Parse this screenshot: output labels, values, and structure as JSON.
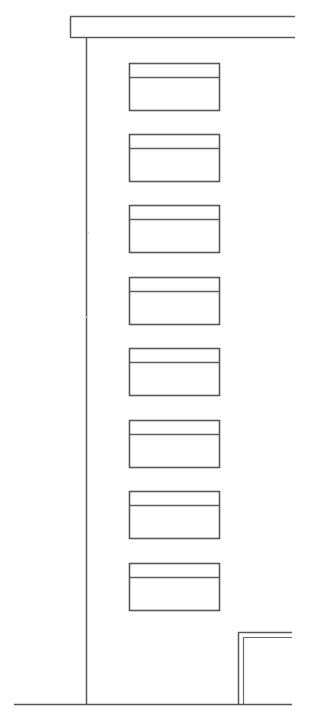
{
  "drawing": {
    "type": "architectural-elevation",
    "title": "Building Elevation",
    "canvas": {
      "width": 309,
      "height": 728
    },
    "background_color": "#ffffff",
    "line_color": "#5a5a5a",
    "fill_color": "#ffffff"
  },
  "roof_band": {
    "name": "roof-parapet-band",
    "x": 70,
    "y": 16,
    "width": 225,
    "height": 21,
    "left_capped": true,
    "right_open": true
  },
  "wall_line": {
    "name": "front-wall-edge",
    "x": 86,
    "y_top": 37,
    "y_bottom": 704
  },
  "windows": {
    "count": 8,
    "left": 129,
    "right": 219,
    "width": 90,
    "height": 47,
    "pitch": 71,
    "transom_offset": 14,
    "items": [
      {
        "label": "window-floor-8",
        "top": 63
      },
      {
        "label": "window-floor-7",
        "top": 134
      },
      {
        "label": "window-floor-6",
        "top": 205
      },
      {
        "label": "window-floor-5",
        "top": 277
      },
      {
        "label": "window-floor-4",
        "top": 348
      },
      {
        "label": "window-floor-3",
        "top": 420
      },
      {
        "label": "window-floor-2",
        "top": 491
      },
      {
        "label": "window-floor-1",
        "top": 563
      }
    ]
  },
  "corner_detail": {
    "name": "adjacent-structure-corner",
    "outer_vertical_x": 238,
    "inner_vertical_x": 243,
    "outer_horizontal_y": 632,
    "inner_horizontal_y": 637,
    "right_extent": 292,
    "bottom_y": 704
  },
  "ground_line": {
    "name": "ground-datum-line",
    "y": 704,
    "x_start": 14,
    "x_end": 292
  },
  "artifacts": [
    {
      "name": "scan-speck",
      "x": 88,
      "y": 233,
      "r": 1.1
    },
    {
      "name": "scan-speck",
      "x": 87,
      "y": 317,
      "r": 0.9
    }
  ]
}
